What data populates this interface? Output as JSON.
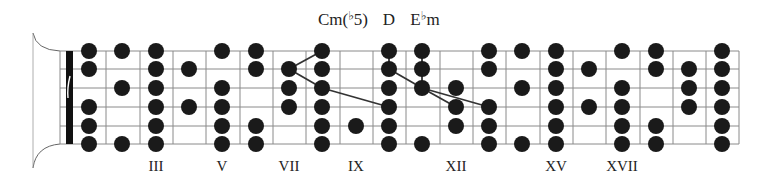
{
  "diagram": {
    "type": "guitar-fretboard",
    "colors": {
      "dot": "#1a1a1a",
      "grid": "#8a8a8a",
      "nut": "#111111",
      "connector": "#333333",
      "text": "#222222"
    },
    "chord_labels": [
      {
        "id": "cm-b5",
        "prefix": "Cm(",
        "flat": "♭",
        "suffix": "5)",
        "x": 343
      },
      {
        "id": "d",
        "prefix": "D",
        "flat": "",
        "suffix": "",
        "x": 389
      },
      {
        "id": "eb-m",
        "prefix": "E",
        "flat": "♭",
        "suffix": "m",
        "x": 425
      }
    ],
    "fret_labels": [
      {
        "text": "III",
        "x": 156
      },
      {
        "text": "V",
        "x": 222
      },
      {
        "text": "VII",
        "x": 289
      },
      {
        "text": "IX",
        "x": 356
      },
      {
        "text": "XII",
        "x": 456
      },
      {
        "text": "XV",
        "x": 556
      },
      {
        "text": "XVII",
        "x": 622
      }
    ],
    "strings_y": [
      51,
      69,
      88,
      107,
      126,
      144
    ],
    "fret_lines_x": [
      60,
      106,
      140,
      173,
      206,
      240,
      273,
      306,
      340,
      373,
      406,
      440,
      473,
      506,
      540,
      573,
      606,
      640,
      673,
      706,
      739
    ],
    "nut": {
      "x": 66,
      "width": 7
    },
    "dot_radius": 8,
    "dot_columns": [
      {
        "x": 89,
        "strings": [
          1,
          2,
          4,
          5,
          6
        ]
      },
      {
        "x": 122,
        "strings": [
          1,
          3,
          6
        ]
      },
      {
        "x": 156,
        "strings": [
          1,
          2,
          3,
          4,
          5,
          6
        ]
      },
      {
        "x": 189,
        "strings": [
          2,
          4
        ]
      },
      {
        "x": 222,
        "strings": [
          1,
          3,
          4,
          5,
          6
        ]
      },
      {
        "x": 256,
        "strings": [
          1,
          2,
          5,
          6
        ]
      },
      {
        "x": 289,
        "strings": [
          2,
          3,
          4
        ]
      },
      {
        "x": 322,
        "strings": [
          1,
          2,
          3,
          4,
          5,
          6
        ]
      },
      {
        "x": 356,
        "strings": [
          5
        ]
      },
      {
        "x": 389,
        "strings": [
          1,
          2,
          3,
          4,
          5,
          6
        ]
      },
      {
        "x": 422,
        "strings": [
          1,
          2,
          3,
          6
        ]
      },
      {
        "x": 456,
        "strings": [
          3,
          4,
          5
        ]
      },
      {
        "x": 489,
        "strings": [
          1,
          2,
          4,
          5,
          6
        ]
      },
      {
        "x": 522,
        "strings": [
          1,
          3,
          6
        ]
      },
      {
        "x": 556,
        "strings": [
          1,
          2,
          3,
          4,
          5,
          6
        ]
      },
      {
        "x": 589,
        "strings": [
          2,
          4
        ]
      },
      {
        "x": 622,
        "strings": [
          1,
          3,
          4,
          5,
          6
        ]
      },
      {
        "x": 656,
        "strings": [
          1,
          2,
          5,
          6
        ]
      },
      {
        "x": 689,
        "strings": [
          2,
          3,
          4
        ]
      },
      {
        "x": 722,
        "strings": [
          1,
          2,
          3,
          4,
          5,
          6
        ]
      }
    ],
    "connectors": [
      {
        "chord": "cm-b5",
        "from": [
          289,
          2
        ],
        "to": [
          322,
          1
        ]
      },
      {
        "chord": "cm-b5",
        "from": [
          289,
          2
        ],
        "to": [
          322,
          3
        ]
      },
      {
        "chord": "cm-b5",
        "from": [
          322,
          3
        ],
        "to": [
          389,
          4
        ]
      },
      {
        "chord": "d",
        "from": [
          389,
          1
        ],
        "to": [
          389,
          2
        ]
      },
      {
        "chord": "d",
        "from": [
          389,
          2
        ],
        "to": [
          422,
          3
        ]
      },
      {
        "chord": "eb-m",
        "from": [
          422,
          1
        ],
        "to": [
          422,
          2
        ]
      },
      {
        "chord": "eb-m",
        "from": [
          422,
          2
        ],
        "to": [
          422,
          3
        ]
      },
      {
        "chord": "eb-m",
        "from": [
          422,
          3
        ],
        "to": [
          456,
          4
        ]
      },
      {
        "chord": "eb-m",
        "from": [
          422,
          3
        ],
        "to": [
          489,
          4
        ]
      }
    ]
  }
}
